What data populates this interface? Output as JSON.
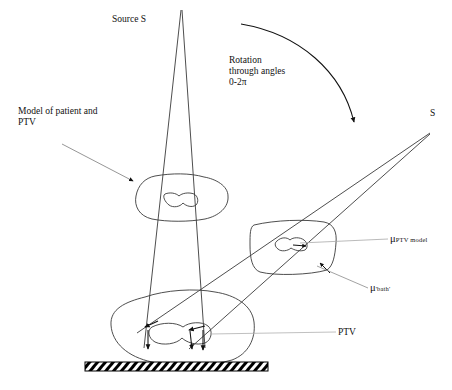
{
  "figure": {
    "type": "schematic-diagram",
    "background_color": "#ffffff",
    "line_color": "#3a3a3a",
    "ink_color": "#111111"
  },
  "labels": {
    "source_s": "Source S",
    "rotation": "Rotation\nthrough angles\n0-2π",
    "model_of_patient": "Model of patient and\nPTV",
    "s_right": "S",
    "mu_ptv_model_symbol": "μ",
    "mu_ptv_model_sub": "PTV model",
    "mu_bath_symbol": "μ",
    "mu_bath_sub": "'bath'",
    "ptv": "PTV"
  },
  "elements": {
    "source_top": {
      "name": "vertical-source",
      "x": 181,
      "y": 10
    },
    "source_rotated": {
      "name": "rotated-source",
      "x": 430,
      "y": 133
    },
    "patient_model_upper": {
      "name": "upper-patient-outline",
      "cx": 175,
      "cy": 196
    },
    "patient_model_right": {
      "name": "right-patient-outline",
      "cx": 294,
      "cy": 250
    },
    "patient_model_lower": {
      "name": "lower-patient-outline",
      "cx": 200,
      "cy": 325
    },
    "couch": {
      "name": "hatched-couch-base",
      "x": 85,
      "y": 362,
      "width": 183,
      "height": 9
    },
    "rotation_arc": {
      "name": "rotation-arc-arrow",
      "from_x": 241,
      "from_y": 24,
      "to_x": 356,
      "to_y": 128
    }
  }
}
